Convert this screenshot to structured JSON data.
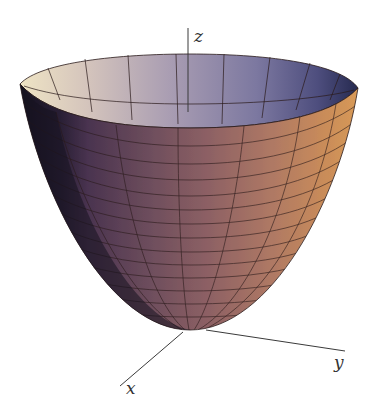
{
  "figure": {
    "axes": {
      "x_label": "x",
      "y_label": "y",
      "z_label": "z"
    },
    "colors": {
      "background": "#ffffff",
      "axis": "#3a3a3a",
      "grid_line": "#2a1a1a",
      "rim_light": "#e9dcc0",
      "rim_blue": "#4a4a78",
      "shadow_left": "#1e1830",
      "body_purple": "#6a4a62",
      "body_mauve": "#8a5e62",
      "body_orange": "#c88a5a"
    }
  }
}
